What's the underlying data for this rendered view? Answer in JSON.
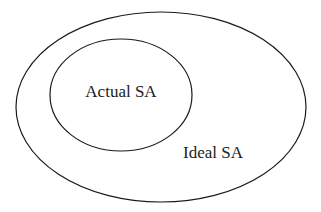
{
  "diagram": {
    "type": "nested-ellipses",
    "outer": {
      "label": "Ideal SA"
    },
    "inner": {
      "label": "Actual SA"
    },
    "stroke_color": "#1a1a1a",
    "background": "#ffffff"
  }
}
